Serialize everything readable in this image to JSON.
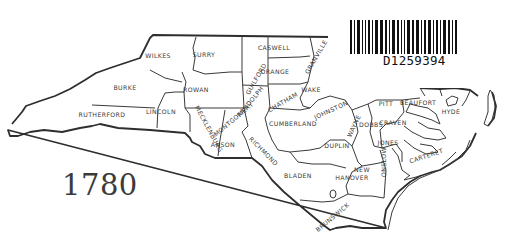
{
  "map": {
    "title_year": "1780",
    "region": "North Carolina counties",
    "counties": [
      {
        "name": "WILKES",
        "x": 158,
        "y": 58
      },
      {
        "name": "SURRY",
        "x": 204,
        "y": 57
      },
      {
        "name": "CASWELL",
        "x": 274,
        "y": 50
      },
      {
        "name": "GRANVILLE",
        "x": 318,
        "y": 58,
        "rotate": -60
      },
      {
        "name": "GUILFORD",
        "x": 258,
        "y": 80,
        "rotate": -60
      },
      {
        "name": "ORANGE",
        "x": 275,
        "y": 74
      },
      {
        "name": "BURKE",
        "x": 125,
        "y": 90
      },
      {
        "name": "ROWAN",
        "x": 196,
        "y": 92
      },
      {
        "name": "RANDOLPH",
        "x": 252,
        "y": 103,
        "rotate": -50
      },
      {
        "name": "CHATHAM",
        "x": 284,
        "y": 104,
        "rotate": -30
      },
      {
        "name": "WAKE",
        "x": 311,
        "y": 92
      },
      {
        "name": "JOHNSTON",
        "x": 332,
        "y": 112,
        "rotate": -25
      },
      {
        "name": "WAYNE",
        "x": 356,
        "y": 127,
        "rotate": -65
      },
      {
        "name": "PITT",
        "x": 386,
        "y": 106
      },
      {
        "name": "BEAUFORT",
        "x": 418,
        "y": 105
      },
      {
        "name": "HYDE",
        "x": 451,
        "y": 114
      },
      {
        "name": "RUTHERFORD",
        "x": 102,
        "y": 117
      },
      {
        "name": "LINCOLN",
        "x": 161,
        "y": 114
      },
      {
        "name": "MECKLENBURG",
        "x": 207,
        "y": 130,
        "rotate": 62
      },
      {
        "name": "MONTGOMERY",
        "x": 235,
        "y": 121,
        "rotate": -40
      },
      {
        "name": "CUMBERLAND",
        "x": 293,
        "y": 126
      },
      {
        "name": "DOBBS",
        "x": 371,
        "y": 127
      },
      {
        "name": "CRAVEN",
        "x": 393,
        "y": 125
      },
      {
        "name": "ANSON",
        "x": 223,
        "y": 147
      },
      {
        "name": "RICHMOND",
        "x": 262,
        "y": 153,
        "rotate": 45
      },
      {
        "name": "DUPLIN",
        "x": 337,
        "y": 148
      },
      {
        "name": "JONES",
        "x": 388,
        "y": 145
      },
      {
        "name": "ONSLOW",
        "x": 386,
        "y": 162,
        "rotate": -90
      },
      {
        "name": "CARTERET",
        "x": 427,
        "y": 158,
        "rotate": -18
      },
      {
        "name": "NEW",
        "x": 362,
        "y": 172
      },
      {
        "name": "HANOVER",
        "x": 352,
        "y": 180
      },
      {
        "name": "BLADEN",
        "x": 298,
        "y": 178
      },
      {
        "name": "BRUNSWICK",
        "x": 334,
        "y": 219,
        "rotate": -40
      }
    ]
  },
  "label": {
    "barcode_text": "D1259394"
  }
}
